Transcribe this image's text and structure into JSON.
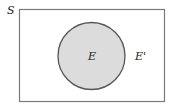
{
  "diagram": {
    "type": "venn",
    "universe_label": "S",
    "set_label": "E",
    "complement_label": "E'",
    "colors": {
      "border": "#6e6e6e",
      "circle_stroke": "#555555",
      "circle_fill": "#dcdcdc",
      "text": "#222222"
    }
  }
}
